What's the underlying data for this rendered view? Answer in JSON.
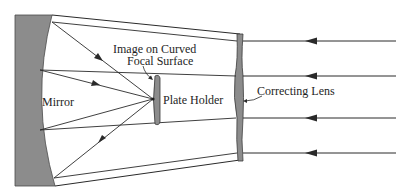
{
  "diagram": {
    "labels": {
      "mirror": "Mirror",
      "image_line1": "Image on Curved",
      "image_line2": "Focal Surface",
      "plate_holder": "Plate Holder",
      "correcting_lens": "Correcting Lens"
    },
    "colors": {
      "fill": "#8c8c8c",
      "stroke": "#2a2a2a",
      "background": "#ffffff"
    },
    "incoming_rays_count": 4
  }
}
